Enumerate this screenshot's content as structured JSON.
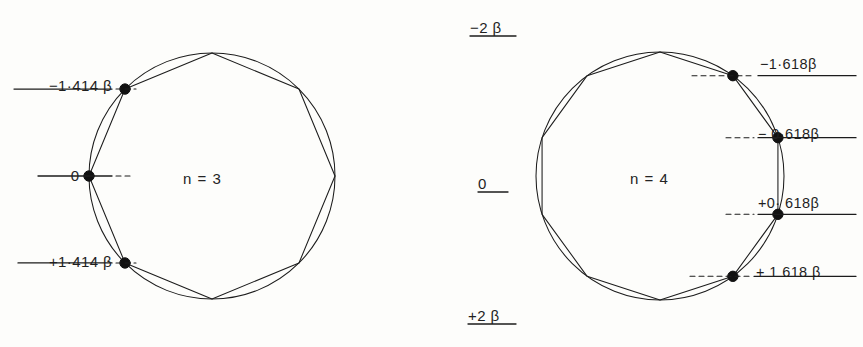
{
  "figure": {
    "background": "#fdfdfb",
    "ink": "#1a1a1a",
    "width": 863,
    "height": 347
  },
  "left_diagram": {
    "name": "frost-circle-n3",
    "center_label": "n = 3",
    "polygon_sides": 8,
    "circle": {
      "cx": 212,
      "cy": 176,
      "r": 123
    },
    "levels": [
      {
        "id": "l-top",
        "text_sign": "−1",
        "text_dot": "·",
        "text_frac": "414",
        "text_beta": "β",
        "full": "−1·414 β",
        "value": -1.414,
        "y": 94,
        "line_x1": 14,
        "line_x2": 112,
        "dash_x1": 116,
        "dash_x2": 136
      },
      {
        "id": "l-mid",
        "text_sign": "",
        "text_dot": "",
        "text_frac": "0",
        "text_beta": "",
        "full": "0",
        "value": 0.0,
        "y": 184,
        "line_x1": 38,
        "line_x2": 112,
        "dash_x1": 116,
        "dash_x2": 132
      },
      {
        "id": "l-bottom",
        "text_sign": "+1",
        "text_dot": "·",
        "text_frac": "414",
        "text_beta": "β",
        "full": "+1·414 β",
        "value": 1.414,
        "y": 270,
        "line_x1": 18,
        "line_x2": 112,
        "dash_x1": 116,
        "dash_x2": 136
      }
    ]
  },
  "center_scale": {
    "name": "energy-scale",
    "ticks": [
      {
        "id": "c-top",
        "full": "−2 β",
        "sign": "−2",
        "beta": "β",
        "value": -2.0,
        "y": 36,
        "line_x1": 470,
        "line_x2": 516
      },
      {
        "id": "c-mid",
        "full": "0",
        "sign": "0",
        "beta": "",
        "value": 0.0,
        "y": 192,
        "line_x1": 478,
        "line_x2": 508
      },
      {
        "id": "c-bottom",
        "full": "+2 β",
        "sign": "+2",
        "beta": "β",
        "value": 2.0,
        "y": 324,
        "line_x1": 468,
        "line_x2": 516
      }
    ]
  },
  "right_diagram": {
    "name": "frost-circle-n4",
    "center_label": "n = 4",
    "polygon_sides": 10,
    "circle": {
      "cx": 660,
      "cy": 176,
      "r": 124
    },
    "levels": [
      {
        "id": "r-1",
        "full": "−1·618β",
        "sign": "−1",
        "dot": "·",
        "frac": "618",
        "beta": "β",
        "value": -1.618,
        "y": 73,
        "line_x1": 758,
        "line_x2": 856,
        "dash_x1": 692,
        "dash_x2": 754
      },
      {
        "id": "r-2",
        "full": "− 0·618β",
        "sign": "− 0",
        "dot": "·",
        "frac": "618",
        "beta": "β",
        "value": -0.618,
        "y": 143,
        "line_x1": 758,
        "line_x2": 856,
        "dash_x1": 726,
        "dash_x2": 754
      },
      {
        "id": "r-3",
        "full": "+0· 618β",
        "sign": "+0",
        "dot": "·",
        "frac": "618",
        "beta": "β",
        "value": 0.618,
        "y": 212,
        "line_x1": 758,
        "line_x2": 856,
        "dash_x1": 726,
        "dash_x2": 754
      },
      {
        "id": "r-4",
        "full": "+ 1 618 β",
        "sign": "+ 1",
        "dot": "",
        "frac": "618",
        "beta": "β",
        "value": 1.618,
        "y": 281,
        "line_x1": 754,
        "line_x2": 856,
        "dash_x1": 690,
        "dash_x2": 750
      }
    ]
  }
}
